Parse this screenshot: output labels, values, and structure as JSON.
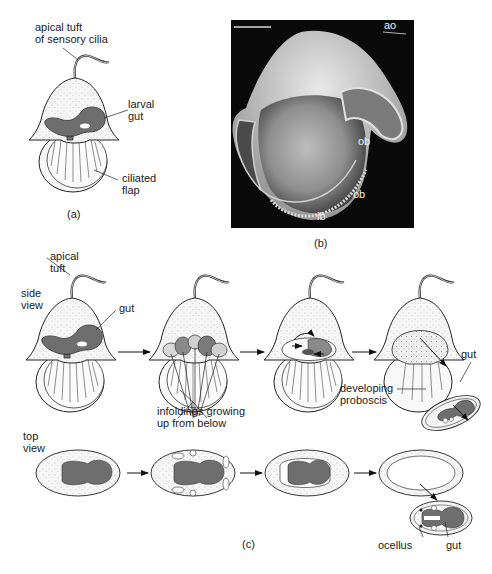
{
  "figure": {
    "panel_a": {
      "caption": "(a)",
      "labels": {
        "apical_tuft": [
          "apical tuft",
          "of sensory cilia"
        ],
        "larval_gut": [
          "larval",
          "gut"
        ],
        "ciliated_flap": [
          "ciliated",
          "flap"
        ]
      }
    },
    "panel_b": {
      "caption": "(b)",
      "photo_labels": {
        "ao": "ao",
        "ob_upper": "ob",
        "ob_lower": "ob",
        "ib": "ib"
      }
    },
    "panel_c": {
      "caption": "(c)",
      "row_labels": {
        "side_view": [
          "side",
          "view"
        ],
        "top_view": [
          "top",
          "view"
        ]
      },
      "labels": {
        "apical_tuft": [
          "apical",
          "tuft"
        ],
        "gut_side": "gut",
        "infoldings": [
          "infoldings growing",
          "up from below"
        ],
        "gut_juvenile": "gut",
        "developing_proboscis": [
          "developing",
          "proboscis"
        ],
        "ocellus": "ocellus",
        "gut_top": "gut"
      }
    },
    "colors": {
      "gut_fill": "#6e6e6e",
      "body_fill": "#f4f4f4",
      "outline": "#222222",
      "photo_bg": "#0a0a0a"
    }
  }
}
